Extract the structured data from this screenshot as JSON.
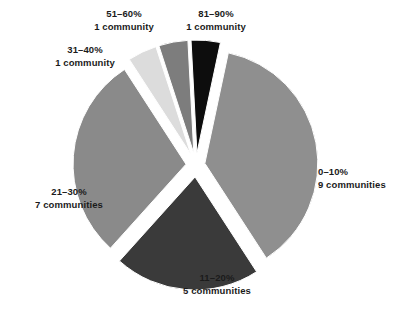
{
  "chart_data": {
    "type": "pie",
    "title": "",
    "subtitle": "",
    "xlabel": "",
    "ylabel": "",
    "legend_position": "none",
    "grid": false,
    "unit": "communities",
    "total": 24,
    "categories": [
      "0–10%",
      "11–20%",
      "21–30%",
      "31–40%",
      "51–60%",
      "81–90%"
    ],
    "values": [
      9,
      5,
      7,
      1,
      1,
      1
    ],
    "slices": [
      {
        "id": "slice-0-10",
        "range": "0–10%",
        "count": 9,
        "count_label": "9 communities",
        "value": 9,
        "percent": 37.5,
        "color": "#8f8f8f",
        "start_angle": 12,
        "end_angle": 147,
        "explode": 9
      },
      {
        "id": "slice-11-20",
        "range": "11–20%",
        "count": 5,
        "count_label": "5 communities",
        "value": 5,
        "percent": 20.8,
        "color": "#3a3a3a",
        "start_angle": 147,
        "end_angle": 222,
        "explode": 12
      },
      {
        "id": "slice-21-30",
        "range": "21–30%",
        "count": 7,
        "count_label": "7 communities",
        "value": 7,
        "percent": 29.2,
        "color": "#8a8a8a",
        "start_angle": 222,
        "end_angle": 327,
        "explode": 10
      },
      {
        "id": "slice-31-40",
        "range": "31–40%",
        "count": 1,
        "count_label": "1 community",
        "value": 1,
        "percent": 4.2,
        "color": "#dcdcdc",
        "start_angle": 327,
        "end_angle": 342,
        "explode": 12
      },
      {
        "id": "slice-51-60",
        "range": "51–60%",
        "count": 1,
        "count_label": "1 community",
        "value": 1,
        "percent": 4.2,
        "color": "#7d7d7d",
        "start_angle": 342,
        "end_angle": 357,
        "explode": 12
      },
      {
        "id": "slice-81-90",
        "range": "81–90%",
        "count": 1,
        "count_label": "1 community",
        "value": 1,
        "percent": 4.2,
        "color": "#0d0d0d",
        "start_angle": 357,
        "end_angle": 372,
        "explode": 12
      }
    ],
    "geometry": {
      "center_x": 196,
      "center_y": 165,
      "radius": 113
    },
    "colors": {
      "background": "#ffffff",
      "label_text": "#1b1b1b",
      "slice_0_10": "#8f8f8f",
      "slice_11_20": "#3a3a3a",
      "slice_21_30": "#8a8a8a",
      "slice_31_40": "#dcdcdc",
      "slice_51_60": "#7d7d7d",
      "slice_81_90": "#0d0d0d"
    }
  },
  "labels": {
    "l0_10": {
      "range": "0–10%",
      "count": "9 communities"
    },
    "l11_20": {
      "range": "11–20%",
      "count": "5 communities"
    },
    "l21_30": {
      "range": "21–30%",
      "count": "7 communities"
    },
    "l31_40": {
      "range": "31–40%",
      "count": "1 community"
    },
    "l51_60": {
      "range": "51–60%",
      "count": "1 community"
    },
    "l81_90": {
      "range": "81–90%",
      "count": "1 community"
    }
  }
}
